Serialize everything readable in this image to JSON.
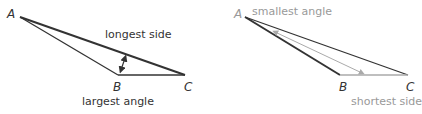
{
  "left_diagram": {
    "vertices": {
      "a": "A",
      "b": "B",
      "c": "C"
    },
    "label_side": "longest side",
    "label_angle": "largest angle"
  },
  "right_diagram": {
    "vertices": {
      "a": "A",
      "b": "B",
      "c": "C"
    },
    "label_angle": "smallest angle",
    "label_side": "shortest side"
  },
  "colors": {
    "dark": "#333333",
    "gray": "#999999"
  }
}
